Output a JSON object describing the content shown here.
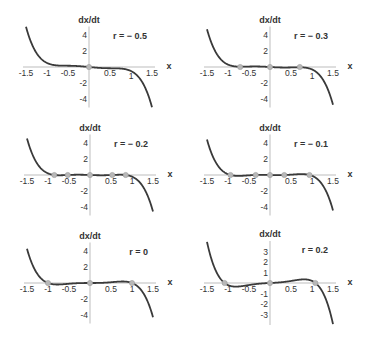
{
  "chart_data": [
    {
      "type": "line",
      "title": "r = − 0.5",
      "r": -0.5,
      "xlabel": "x",
      "ylabel": "dx/dt",
      "xlim": [
        -1.5,
        1.5
      ],
      "ylim": [
        -5,
        5
      ],
      "xticks": [
        "-1.5",
        "-1",
        "-0.5",
        "0.5",
        "1",
        "1.5"
      ],
      "yticks": [
        "4",
        "2",
        "-2",
        "-4"
      ],
      "fixed_points": [
        0
      ],
      "function": "dx/dt = r x + x^3 - x^5"
    },
    {
      "type": "line",
      "title": "r = − 0.3",
      "r": -0.3,
      "xlabel": "x",
      "ylabel": "dx/dt",
      "xlim": [
        -1.5,
        1.5
      ],
      "ylim": [
        -5,
        5
      ],
      "xticks": [
        "-1.5",
        "-1",
        "-0.5",
        "0.5",
        "1",
        "1.5"
      ],
      "yticks": [
        "4",
        "2",
        "-2",
        "-4"
      ],
      "fixed_points": [
        -0.71,
        0,
        0.71
      ],
      "function": "dx/dt = r x + x^3 - x^5"
    },
    {
      "type": "line",
      "title": "r = − 0.2",
      "r": -0.2,
      "xlabel": "x",
      "ylabel": "dx/dt",
      "xlim": [
        -1.5,
        1.5
      ],
      "ylim": [
        -5,
        5
      ],
      "xticks": [
        "-1.5",
        "-1",
        "-0.5",
        "0.5",
        "1",
        "1.5"
      ],
      "yticks": [
        "4",
        "2",
        "-2",
        "-4"
      ],
      "fixed_points": [
        -0.85,
        -0.53,
        0,
        0.53,
        0.85
      ],
      "function": "dx/dt = r x + x^3 - x^5"
    },
    {
      "type": "line",
      "title": "r = − 0.1",
      "r": -0.1,
      "xlabel": "x",
      "ylabel": "dx/dt",
      "xlim": [
        -1.5,
        1.5
      ],
      "ylim": [
        -5,
        5
      ],
      "xticks": [
        "-1.5",
        "-1",
        "-0.5",
        "0.5",
        "1",
        "1.5"
      ],
      "yticks": [
        "4",
        "2",
        "-2",
        "-4"
      ],
      "fixed_points": [
        -0.94,
        -0.34,
        0,
        0.34,
        0.94
      ],
      "function": "dx/dt = r x + x^3 - x^5"
    },
    {
      "type": "line",
      "title": "r = 0",
      "r": 0,
      "xlabel": "x",
      "ylabel": "dx/dt",
      "xlim": [
        -1.5,
        1.5
      ],
      "ylim": [
        -5,
        5
      ],
      "xticks": [
        "-1.5",
        "-1",
        "-0.5",
        "0.5",
        "1",
        "1.5"
      ],
      "yticks": [
        "4",
        "2",
        "-2",
        "-4"
      ],
      "fixed_points": [
        -1,
        0,
        1
      ],
      "function": "dx/dt = r x + x^3 - x^5"
    },
    {
      "type": "line",
      "title": "r = 0.2",
      "r": 0.2,
      "xlabel": "x",
      "ylabel": "dx/dt",
      "xlim": [
        -1.5,
        1.5
      ],
      "ylim": [
        -4,
        4
      ],
      "xticks": [
        "-1.5",
        "-1",
        "-0.5",
        "0.5",
        "1",
        "1.5"
      ],
      "yticks": [
        "3",
        "2",
        "1",
        "-1",
        "-2",
        "-3"
      ],
      "fixed_points": [
        -1.08,
        0,
        1.08
      ],
      "function": "dx/dt = r x + x^3 - x^5"
    }
  ],
  "panels": [
    {
      "title": "r = − 0.5",
      "r": -0.5,
      "ox": 89,
      "oy": 67,
      "sy": 8.1,
      "ylim": 5,
      "yticks": [
        4,
        2,
        -2,
        -4
      ],
      "fps": [
        0
      ]
    },
    {
      "title": "r = − 0.3",
      "r": -0.3,
      "ox": 270,
      "oy": 67,
      "sy": 8.1,
      "ylim": 5,
      "yticks": [
        4,
        2,
        -2,
        -4
      ],
      "fps": [
        -0.71,
        0,
        0.71
      ]
    },
    {
      "title": "r = − 0.2",
      "r": -0.2,
      "ox": 90,
      "oy": 175,
      "sy": 8.1,
      "ylim": 5,
      "yticks": [
        4,
        2,
        -2,
        -4
      ],
      "fps": [
        -0.85,
        -0.53,
        0,
        0.53,
        0.85
      ]
    },
    {
      "title": "r = − 0.1",
      "r": -0.1,
      "ox": 270,
      "oy": 175,
      "sy": 8.1,
      "ylim": 5,
      "yticks": [
        4,
        2,
        -2,
        -4
      ],
      "fps": [
        -0.94,
        -0.34,
        0,
        0.34,
        0.94
      ]
    },
    {
      "title": "r = 0",
      "r": 0,
      "ox": 90,
      "oy": 283,
      "sy": 8.1,
      "ylim": 5,
      "yticks": [
        4,
        2,
        -2,
        -4
      ],
      "fps": [
        -1,
        0,
        1
      ]
    },
    {
      "title": "r = 0.2",
      "r": 0.2,
      "ox": 270,
      "oy": 283,
      "sy": 10.5,
      "ylim": 4,
      "yticks": [
        3,
        2,
        1,
        -1,
        -2,
        -3
      ],
      "fps": [
        -1.08,
        0,
        1.08
      ]
    }
  ],
  "labels": {
    "ylabel": "dx/dt",
    "xlabel": "x",
    "xticks": [
      -1.5,
      -1,
      -0.5,
      0.5,
      1,
      1.5
    ]
  }
}
